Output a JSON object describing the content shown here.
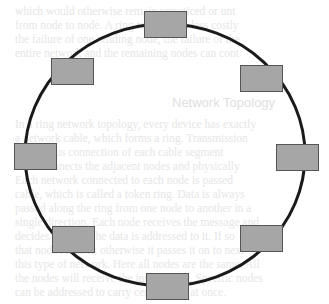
{
  "diagram": {
    "title": "Ring network topology",
    "type": "ring",
    "ring": {
      "cx": 165,
      "cy": 155,
      "rx": 140,
      "ry": 131,
      "stroke": "#1a1a1a",
      "stroke_width": 3
    },
    "node_style": {
      "fill": "#a6a6a6",
      "stroke": "#555555",
      "width": 42,
      "height": 26
    },
    "nodes": [
      {
        "id": "node-top",
        "x": 144,
        "y": 11
      },
      {
        "id": "node-top-left",
        "x": 51,
        "y": 58
      },
      {
        "id": "node-top-right",
        "x": 240,
        "y": 65
      },
      {
        "id": "node-left",
        "x": 14,
        "y": 143
      },
      {
        "id": "node-right",
        "x": 276,
        "y": 144
      },
      {
        "id": "node-bottom-left",
        "x": 52,
        "y": 226
      },
      {
        "id": "node-bottom-right",
        "x": 240,
        "y": 225
      },
      {
        "id": "node-bottom",
        "x": 146,
        "y": 273
      }
    ]
  },
  "background_text": {
    "color": "#e6e6e6",
    "lines": [
      {
        "x": 15,
        "y": 5,
        "text": "which would otherwise remain unnoticed or unt"
      },
      {
        "x": 15,
        "y": 19,
        "text": "from node to node. A ring topology is less costly"
      },
      {
        "x": 15,
        "y": 33,
        "text": "the failure of one sending node, the failure of the"
      },
      {
        "x": 15,
        "y": 47,
        "text": "entire network and the remaining nodes can cont"
      },
      {
        "x": 15,
        "y": 118,
        "text": "In a ring network topology, every device has exactly"
      },
      {
        "x": 15,
        "y": 132,
        "text": "a network cable, which forms a ring. Transmission"
      },
      {
        "x": 15,
        "y": 146,
        "text": "continuous connection of each cable segment"
      },
      {
        "x": 15,
        "y": 160,
        "text": "cable connects the adjacent nodes and physically"
      },
      {
        "x": 15,
        "y": 174,
        "text": "Each network connected to each node is passed"
      },
      {
        "x": 15,
        "y": 188,
        "text": "cable, which is called a token ring. Data is always"
      },
      {
        "x": 15,
        "y": 202,
        "text": "passed along the ring from one node to another in a"
      },
      {
        "x": 15,
        "y": 216,
        "text": "single direction. Each node receives the message and"
      },
      {
        "x": 15,
        "y": 230,
        "text": "decides whether the data is addressed to it. If so"
      },
      {
        "x": 15,
        "y": 244,
        "text": "that node reads it; otherwise it passes it on to next"
      },
      {
        "x": 15,
        "y": 258,
        "text": "this type of network. Here all nodes are the same. All"
      },
      {
        "x": 15,
        "y": 272,
        "text": "the nodes will receive the information. Specific nodes"
      },
      {
        "x": 15,
        "y": 286,
        "text": "can be addressed to carry certain data at once."
      }
    ],
    "heading": {
      "x": 172,
      "y": 96,
      "text": "Network Topology"
    }
  }
}
